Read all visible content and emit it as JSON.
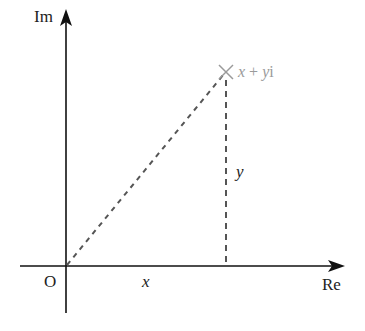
{
  "diagram": {
    "axes": {
      "imaginary_label": "Im",
      "real_label": "Re",
      "origin_label": "O"
    },
    "point": {
      "label_x": "x",
      "label_plus": " + ",
      "label_y": "y",
      "label_i": "i",
      "full_label": "x + yi",
      "marker": "cross"
    },
    "segments": {
      "horizontal_label": "x",
      "vertical_label": "y"
    },
    "colors": {
      "axis": "#111111",
      "dashed": "#555555",
      "marker": "#9a9a9a",
      "point_label": "#9a9a9a"
    }
  }
}
